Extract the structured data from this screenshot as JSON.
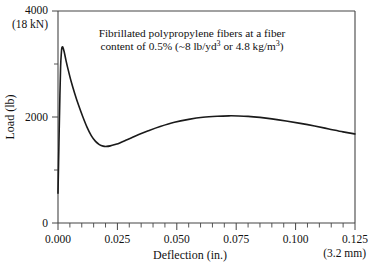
{
  "chart_data": {
    "type": "line",
    "title": "",
    "annotation_lines": [
      "Fibrillated polypropylene fibers at a fiber",
      "content of 0.5% (~8 lb/yd3 or 4.8 kg/m3)"
    ],
    "annotation_line1": "Fibrillated polypropylene fibers at a fiber",
    "annotation_line2_a": "content of 0.5% (~8 lb/yd",
    "annotation_line2_sup1": "3",
    "annotation_line2_b": " or 4.8 kg/m",
    "annotation_line2_sup2": "3",
    "annotation_line2_c": ")",
    "xlabel": "Deflection (in.)",
    "ylabel": "Load (lb)",
    "xlim": [
      0.0,
      0.125
    ],
    "ylim": [
      0,
      4000
    ],
    "x_tick_labels": [
      "0.000",
      "0.025",
      "0.050",
      "0.075",
      "0.100",
      "0.125"
    ],
    "x_tick_values": [
      0.0,
      0.025,
      0.05,
      0.075,
      0.1,
      0.125
    ],
    "x_minor_count_per_interval": 5,
    "y_tick_labels": [
      "0",
      "2000",
      "4000"
    ],
    "y_tick_values": [
      0,
      2000,
      4000
    ],
    "y_minor_tick_values": [
      1000,
      3000
    ],
    "y_top_secondary_label": "(18 kN)",
    "x_right_secondary_label": "(3.2 mm)",
    "grid": "off",
    "legend": "none",
    "series": [
      {
        "name": "Load vs Deflection",
        "color": "#1a1a1a",
        "x": [
          0.0,
          0.0004,
          0.0008,
          0.0011,
          0.0014,
          0.0016,
          0.002,
          0.0026,
          0.0034,
          0.0044,
          0.0056,
          0.007,
          0.0086,
          0.0104,
          0.0122,
          0.014,
          0.0158,
          0.0174,
          0.019,
          0.0205,
          0.022,
          0.024,
          0.026,
          0.0285,
          0.031,
          0.034,
          0.038,
          0.043,
          0.049,
          0.055,
          0.061,
          0.067,
          0.072,
          0.076,
          0.08,
          0.085,
          0.09,
          0.096,
          0.102,
          0.108,
          0.114,
          0.12,
          0.125
        ],
        "y": [
          560,
          1500,
          2400,
          2950,
          3200,
          3300,
          3320,
          3230,
          3060,
          2870,
          2660,
          2450,
          2230,
          2010,
          1810,
          1650,
          1540,
          1480,
          1450,
          1445,
          1455,
          1480,
          1510,
          1560,
          1610,
          1670,
          1740,
          1820,
          1900,
          1955,
          1995,
          2015,
          2022,
          2020,
          2012,
          1992,
          1965,
          1925,
          1880,
          1830,
          1775,
          1720,
          1680
        ]
      }
    ]
  },
  "figure": {
    "background_color": "#ffffff",
    "axis_color": "#444444",
    "curve_color": "#1a1a1a"
  }
}
